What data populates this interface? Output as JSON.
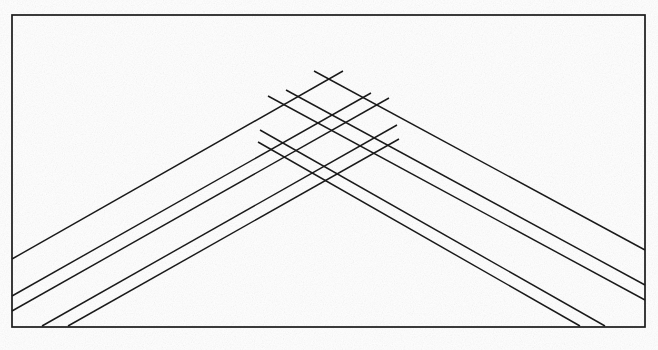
{
  "figure": {
    "kind": "line-art",
    "background_color": "#ffffff",
    "ink_color": "#1a1a1a",
    "canvas": {
      "width": 658,
      "height": 350
    }
  },
  "frame": {
    "name": "outer border rectangle",
    "x": 12,
    "y": 15,
    "width": 633,
    "height": 312,
    "stroke_color": "#1a1a1a",
    "stroke_width": 1.7
  },
  "chart_data": {
    "type": "line",
    "subtitle": "",
    "xlabel": "",
    "ylabel": "",
    "grid": false,
    "legend_position": "none",
    "xlim": [
      12,
      645
    ],
    "ylim": [
      15,
      327
    ],
    "apex": {
      "x": 328,
      "y": 70
    },
    "annotations": [],
    "series": [
      {
        "name": "left-family-ray-1",
        "stroke_color": "#1a1a1a",
        "x": [
          12,
          343
        ],
        "y": [
          259,
          71
        ]
      },
      {
        "name": "left-family-ray-2",
        "stroke_color": "#1a1a1a",
        "x": [
          12,
          371
        ],
        "y": [
          296,
          93
        ]
      },
      {
        "name": "left-family-ray-3",
        "stroke_color": "#1a1a1a",
        "x": [
          12,
          389
        ],
        "y": [
          311,
          98
        ]
      },
      {
        "name": "left-family-ray-4",
        "stroke_color": "#1a1a1a",
        "x": [
          42,
          397
        ],
        "y": [
          326,
          125
        ]
      },
      {
        "name": "left-family-ray-5",
        "stroke_color": "#1a1a1a",
        "x": [
          68,
          399
        ],
        "y": [
          326,
          139
        ]
      },
      {
        "name": "right-family-ray-1",
        "stroke_color": "#1a1a1a",
        "x": [
          645,
          314
        ],
        "y": [
          250,
          71
        ]
      },
      {
        "name": "right-family-ray-2",
        "stroke_color": "#1a1a1a",
        "x": [
          645,
          286
        ],
        "y": [
          285,
          90
        ]
      },
      {
        "name": "right-family-ray-3",
        "stroke_color": "#1a1a1a",
        "x": [
          645,
          268
        ],
        "y": [
          300,
          96
        ]
      },
      {
        "name": "right-family-ray-4",
        "stroke_color": "#1a1a1a",
        "x": [
          605,
          260
        ],
        "y": [
          326,
          130
        ]
      },
      {
        "name": "right-family-ray-5",
        "stroke_color": "#1a1a1a",
        "x": [
          580,
          258
        ],
        "y": [
          326,
          142
        ]
      }
    ],
    "notes": {
      "left_edge_hits": [
        259,
        296,
        311
      ],
      "right_edge_hits": [
        250,
        285,
        300
      ],
      "bottom_edge_hits_left": [
        42,
        68
      ],
      "bottom_edge_hits_right": [
        580,
        605
      ],
      "lattice_region": {
        "x": 255,
        "y": 70,
        "width": 146,
        "height": 100
      }
    }
  }
}
